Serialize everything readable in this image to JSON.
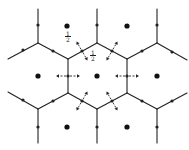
{
  "figure": {
    "colors": {
      "line": "#222222",
      "site": "#111111",
      "background": "#ffffff"
    }
  },
  "labels": [
    {
      "id": "half-top",
      "numerator": "1",
      "denominator": "2",
      "x": 64,
      "y": 31
    },
    {
      "id": "half-edge",
      "numerator": "1",
      "denominator": "2",
      "x": 89,
      "y": 50
    }
  ],
  "edges": [
    [
      38,
      9,
      38,
      43
    ],
    [
      38,
      43,
      8,
      59
    ],
    [
      38,
      43,
      68,
      59
    ],
    [
      97,
      9,
      97,
      43
    ],
    [
      97,
      43,
      68,
      59
    ],
    [
      97,
      43,
      127,
      59
    ],
    [
      157,
      9,
      157,
      43
    ],
    [
      157,
      43,
      127,
      59
    ],
    [
      157,
      43,
      187,
      60
    ],
    [
      68,
      59,
      68,
      93
    ],
    [
      127,
      59,
      127,
      93
    ],
    [
      8,
      92,
      38,
      109
    ],
    [
      38,
      109,
      68,
      93
    ],
    [
      38,
      109,
      38,
      143
    ],
    [
      68,
      93,
      97,
      109
    ],
    [
      97,
      109,
      127,
      93
    ],
    [
      97,
      109,
      97,
      143
    ],
    [
      127,
      93,
      157,
      109
    ],
    [
      157,
      109,
      187,
      93
    ],
    [
      157,
      109,
      157,
      143
    ]
  ],
  "edge_dots": [
    [
      38,
      25
    ],
    [
      23,
      50
    ],
    [
      53,
      51
    ],
    [
      97,
      25
    ],
    [
      82,
      51
    ],
    [
      112,
      51
    ],
    [
      157,
      25
    ],
    [
      142,
      51
    ],
    [
      172,
      52
    ],
    [
      68,
      76
    ],
    [
      127,
      76
    ],
    [
      23,
      100
    ],
    [
      53,
      101
    ],
    [
      38,
      127
    ],
    [
      82,
      101
    ],
    [
      112,
      101
    ],
    [
      97,
      127
    ],
    [
      142,
      101
    ],
    [
      172,
      101
    ],
    [
      157,
      127
    ]
  ],
  "sites": [
    [
      67,
      26
    ],
    [
      127,
      26
    ],
    [
      38,
      76
    ],
    [
      97,
      76
    ],
    [
      157,
      76
    ],
    [
      67,
      127
    ],
    [
      127,
      127
    ]
  ],
  "arrows": [
    {
      "from": [
        68,
        76
      ],
      "dir": [
        -1,
        0
      ],
      "len": 12
    },
    {
      "from": [
        68,
        76
      ],
      "dir": [
        1,
        0
      ],
      "len": 12
    },
    {
      "from": [
        127,
        76
      ],
      "dir": [
        -1,
        0
      ],
      "len": 12
    },
    {
      "from": [
        127,
        76
      ],
      "dir": [
        1,
        0
      ],
      "len": 12
    },
    {
      "from": [
        82,
        51
      ],
      "dir": [
        -0.5,
        -0.866
      ],
      "len": 11
    },
    {
      "from": [
        82,
        51
      ],
      "dir": [
        0.5,
        0.866
      ],
      "len": 11
    },
    {
      "from": [
        112,
        51
      ],
      "dir": [
        0.5,
        -0.866
      ],
      "len": 11
    },
    {
      "from": [
        112,
        51
      ],
      "dir": [
        -0.5,
        0.866
      ],
      "len": 11
    },
    {
      "from": [
        82,
        101
      ],
      "dir": [
        0.5,
        -0.866
      ],
      "len": 11
    },
    {
      "from": [
        82,
        101
      ],
      "dir": [
        -0.5,
        0.866
      ],
      "len": 11
    },
    {
      "from": [
        112,
        101
      ],
      "dir": [
        -0.5,
        -0.866
      ],
      "len": 11
    },
    {
      "from": [
        112,
        101
      ],
      "dir": [
        0.5,
        0.866
      ],
      "len": 11
    }
  ]
}
